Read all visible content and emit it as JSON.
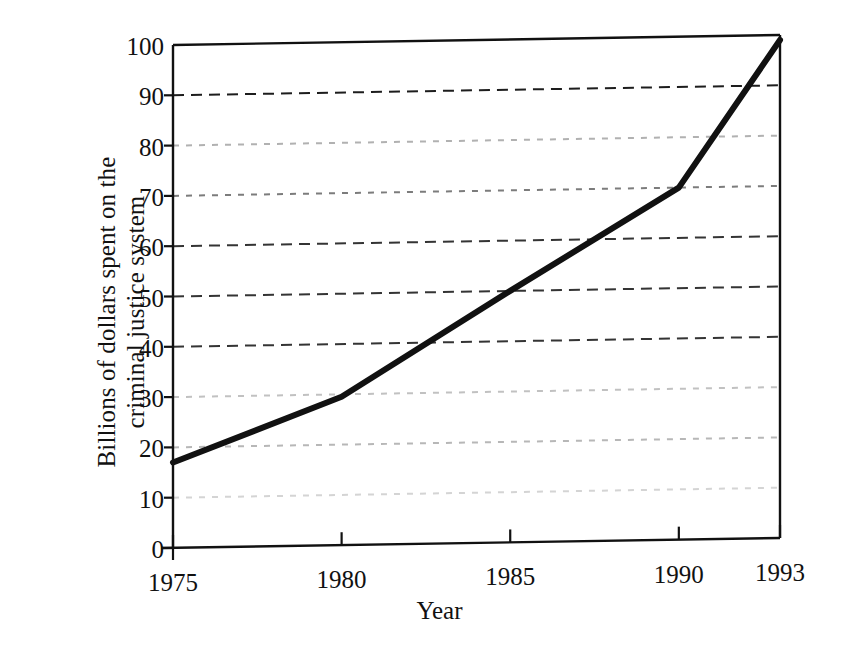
{
  "figure": {
    "kind": "scanned-line-chart",
    "background_color": "#ffffff",
    "ink_color": "#111111"
  },
  "axes": {
    "y_title_line1": "Billions of dollars spent on the",
    "y_title_line2": "criminal justice system",
    "x_title": "Year",
    "y_ticks": [
      "0",
      "10",
      "20",
      "30",
      "40",
      "50",
      "60",
      "70",
      "80",
      "90",
      "100"
    ],
    "x_ticks": [
      "1975",
      "1980",
      "1985",
      "1990",
      "1993"
    ]
  },
  "chart_data": {
    "type": "line",
    "title": "",
    "subtitle": "",
    "xlabel": "Year",
    "ylabel": "Billions of dollars spent on the criminal justice system",
    "xlim": [
      1975,
      1993
    ],
    "ylim": [
      0,
      100
    ],
    "x_tick_values": [
      1975,
      1980,
      1985,
      1990,
      1993
    ],
    "x_tick_labels": [
      "1975",
      "1980",
      "1985",
      "1990",
      "1993"
    ],
    "y_tick_values": [
      0,
      10,
      20,
      30,
      40,
      50,
      60,
      70,
      80,
      90,
      100
    ],
    "y_tick_labels": [
      "0",
      "10",
      "20",
      "30",
      "40",
      "50",
      "60",
      "70",
      "80",
      "90",
      "100"
    ],
    "grid": true,
    "grid_axis": "y",
    "grid_style": "dashed",
    "grid_values": [
      10,
      20,
      30,
      40,
      50,
      60,
      70,
      80,
      90
    ],
    "legend": false,
    "legend_position": "none",
    "annotations": [],
    "series": [
      {
        "name": "Criminal justice system spending",
        "color": "#111111",
        "line_width": 6,
        "marker": "none",
        "x": [
          1975,
          1980,
          1985,
          1990,
          1993
        ],
        "values": [
          17,
          29.5,
          50,
          70,
          99
        ]
      }
    ]
  }
}
